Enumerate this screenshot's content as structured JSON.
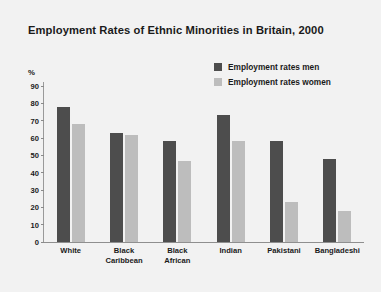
{
  "chart_data": {
    "type": "bar",
    "title": "Employment Rates of Ethnic Minorities in Britain, 2000",
    "xlabel": "",
    "ylabel": "%",
    "ylim": [
      0,
      90
    ],
    "yticks": [
      0,
      10,
      20,
      30,
      40,
      50,
      60,
      70,
      80,
      90
    ],
    "grid": false,
    "legend_position": "top-right",
    "categories": [
      "White",
      "Black Caribbean",
      "Black African",
      "Indian",
      "Pakistani",
      "Bangladeshi"
    ],
    "series": [
      {
        "name": "Employment rates men",
        "color": "#4d4d4d",
        "values": [
          78,
          63,
          58,
          73,
          58,
          48
        ]
      },
      {
        "name": "Employment rates women",
        "color": "#bdbdbd",
        "values": [
          68,
          62,
          47,
          58,
          23,
          18
        ]
      }
    ]
  },
  "colors": {
    "background": "#f2f2f2",
    "men": "#4d4d4d",
    "women": "#bdbdbd",
    "axis": "#8f8f8f",
    "text": "#1a1a1a"
  }
}
